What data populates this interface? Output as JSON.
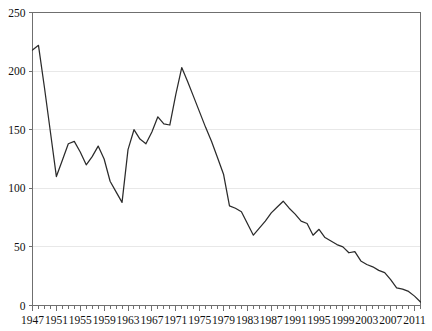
{
  "chart_data": {
    "type": "line",
    "title": "",
    "subtitle": "",
    "xlabel": "",
    "ylabel": "",
    "xlim": [
      1947,
      2012
    ],
    "ylim": [
      0,
      250
    ],
    "grid": true,
    "legend": null,
    "y_ticks": [
      0,
      50,
      100,
      150,
      200,
      250
    ],
    "y_tick_labels": [
      "0",
      "50",
      "100",
      "150",
      "200",
      "250"
    ],
    "x_ticks": [
      1947,
      1951,
      1955,
      1959,
      1963,
      1967,
      1971,
      1975,
      1979,
      1983,
      1987,
      1991,
      1995,
      1999,
      2003,
      2007,
      2011
    ],
    "x_tick_labels": [
      "1947",
      "1951",
      "1955",
      "1959",
      "1963",
      "1967",
      "1971",
      "1975",
      "1979",
      "1983",
      "1987",
      "1991",
      "1995",
      "1999",
      "2003",
      "2007",
      "2011"
    ],
    "x_minor_tick_step": 1,
    "series": [
      {
        "name": "value",
        "color": "#2b2b2b",
        "x": [
          1947,
          1948,
          1949,
          1950,
          1951,
          1952,
          1953,
          1954,
          1955,
          1956,
          1957,
          1958,
          1959,
          1960,
          1961,
          1962,
          1963,
          1964,
          1965,
          1966,
          1967,
          1968,
          1969,
          1970,
          1971,
          1972,
          1973,
          1974,
          1975,
          1976,
          1977,
          1978,
          1979,
          1980,
          1981,
          1982,
          1983,
          1984,
          1985,
          1986,
          1987,
          1988,
          1989,
          1990,
          1991,
          1992,
          1993,
          1994,
          1995,
          1996,
          1997,
          1998,
          1999,
          2000,
          2001,
          2002,
          2003,
          2004,
          2005,
          2006,
          2007,
          2008,
          2009,
          2010,
          2011,
          2012
        ],
        "values": [
          218,
          222,
          186,
          148,
          110,
          124,
          138,
          140,
          131,
          120,
          127,
          136,
          125,
          106,
          97,
          88,
          133,
          150,
          142,
          138,
          148,
          161,
          155,
          154,
          180,
          203,
          191,
          178,
          165,
          152,
          140,
          126,
          112,
          85,
          83,
          80,
          70,
          60,
          66,
          72,
          79,
          84,
          89,
          83,
          78,
          72,
          70,
          60,
          65,
          58,
          55,
          52,
          50,
          45,
          46,
          38,
          35,
          33,
          30,
          28,
          22,
          15,
          14,
          12,
          8,
          3
        ]
      }
    ]
  },
  "axes": {
    "y_axis_name": "y-axis",
    "x_axis_name": "x-axis"
  }
}
